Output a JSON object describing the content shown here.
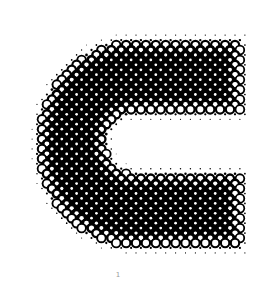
{
  "artwork": {
    "subject": "halftone letter C",
    "letter": "C",
    "ink_color": "#000000",
    "paper_color": "#ffffff",
    "grid_spacing": 7,
    "grid_angle_deg": 45,
    "max_dot_radius": 4.6,
    "shape": {
      "outer_left": 40,
      "outer_top": 42,
      "outer_right": 240,
      "outer_bottom": 245,
      "inner_left": 105,
      "inner_top": 112,
      "inner_bottom": 175,
      "outer_corner_radius": 95,
      "inner_corner_radius": 30,
      "feather": 28
    }
  },
  "caption": {
    "text": "1"
  }
}
